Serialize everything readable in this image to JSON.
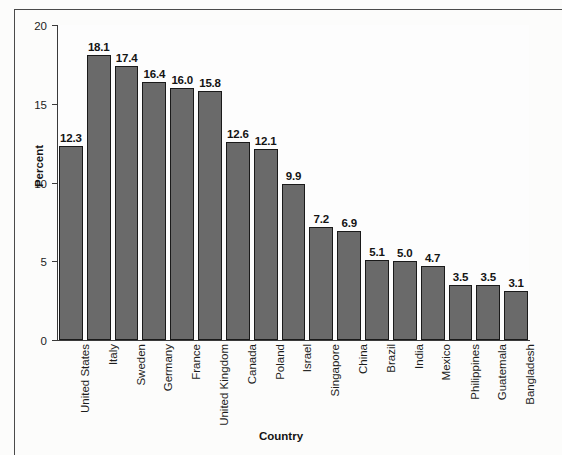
{
  "chart_data": {
    "type": "bar",
    "title": "",
    "xlabel": "Country",
    "ylabel": "Percent",
    "ylim": [
      0,
      20
    ],
    "yticks": [
      "0",
      "5",
      "10",
      "15",
      "20"
    ],
    "grid": false,
    "legend": "none",
    "bar_color": "#6a6a6a",
    "bar_edge_color": "#1a1a1a",
    "categories": [
      "United States",
      "Italy",
      "Sweden",
      "Germany",
      "France",
      "United Kingdom",
      "Canada",
      "Poland",
      "Israel",
      "Singapore",
      "China",
      "Brazil",
      "India",
      "Mexico",
      "Philippines",
      "Guatemala",
      "Bangladesh"
    ],
    "values": [
      12.3,
      18.1,
      17.4,
      16.4,
      16.0,
      15.8,
      12.6,
      12.1,
      9.9,
      7.2,
      6.9,
      5.1,
      5.0,
      4.7,
      3.5,
      3.5,
      3.1
    ],
    "value_labels": [
      "12.3",
      "18.1",
      "17.4",
      "16.4",
      "16.0",
      "15.8",
      "12.6",
      "12.1",
      "9.9",
      "7.2",
      "6.9",
      "5.1",
      "5.0",
      "4.7",
      "3.5",
      "3.5",
      "3.1"
    ]
  }
}
